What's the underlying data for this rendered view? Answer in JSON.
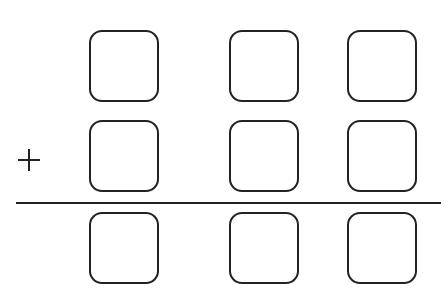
{
  "diagram": {
    "type": "column-addition-template",
    "operator": "+",
    "operator_icon": "plus-icon",
    "columns": 3,
    "rows": [
      {
        "role": "addend-1",
        "boxes": [
          "",
          "",
          ""
        ]
      },
      {
        "role": "addend-2",
        "boxes": [
          "",
          "",
          ""
        ]
      },
      {
        "role": "sum",
        "boxes": [
          "",
          "",
          ""
        ]
      }
    ],
    "colors": {
      "stroke": "#222222",
      "background": "#ffffff"
    }
  }
}
